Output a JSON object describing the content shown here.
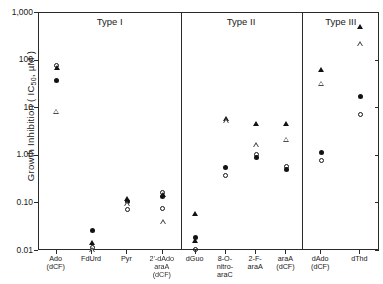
{
  "chart_data": {
    "type": "scatter",
    "title": "",
    "xlabel": "",
    "ylabel": "Growth Inhibition ( IC50, µM )",
    "ylabel_parts": {
      "pre": "Growth Inhibition ( IC",
      "sub": "50",
      "post": ", µM )"
    },
    "yscale": "log",
    "ylim": [
      0.01,
      1000
    ],
    "ytick_labels": [
      "1,000",
      "100",
      "10",
      "1.00",
      "0.10",
      "0.01"
    ],
    "ytick_values": [
      1000,
      100,
      10,
      1.0,
      0.1,
      0.01
    ],
    "grid": false,
    "legend_position": "none",
    "panels": [
      {
        "name": "Type I",
        "categories": [
          {
            "label_lines": [
              "Ado",
              "(dCF)"
            ]
          },
          {
            "label_lines": [
              "FdUrd"
            ]
          },
          {
            "label_lines": [
              "Pyr"
            ]
          },
          {
            "label_lines": [
              "2'-dAdo",
              "araA",
              "(dCF)"
            ]
          }
        ]
      },
      {
        "name": "Type II",
        "categories": [
          {
            "label_lines": [
              "dGuo"
            ]
          },
          {
            "label_lines": [
              "8-O-",
              "nitro-",
              "araC"
            ]
          },
          {
            "label_lines": [
              "2-F-",
              "araA"
            ]
          },
          {
            "label_lines": [
              "araA",
              "(dCF)"
            ]
          }
        ]
      },
      {
        "name": "Type III",
        "categories": [
          {
            "label_lines": [
              "dAdo",
              "(dCF)"
            ]
          },
          {
            "label_lines": [
              "dThd"
            ]
          }
        ]
      }
    ],
    "series": [
      {
        "name": "filled-circle",
        "marker": "m-filled-circle"
      },
      {
        "name": "open-circle",
        "marker": "m-open-circle"
      },
      {
        "name": "filled-triangle",
        "marker": "m-filled-triangle"
      },
      {
        "name": "open-triangle",
        "marker": "m-open-triangle"
      }
    ],
    "points": [
      {
        "panel": 0,
        "cat": 0,
        "series": "open-circle",
        "value": 80
      },
      {
        "panel": 0,
        "cat": 0,
        "series": "filled-triangle",
        "value": 72
      },
      {
        "panel": 0,
        "cat": 0,
        "series": "filled-circle",
        "value": 38
      },
      {
        "panel": 0,
        "cat": 0,
        "series": "open-triangle",
        "value": 8.5
      },
      {
        "panel": 0,
        "cat": 1,
        "series": "filled-circle",
        "value": 0.027
      },
      {
        "panel": 0,
        "cat": 1,
        "series": "filled-triangle",
        "value": 0.0145
      },
      {
        "panel": 0,
        "cat": 1,
        "series": "open-circle",
        "value": 0.0118
      },
      {
        "panel": 0,
        "cat": 1,
        "series": "open-triangle",
        "value": 0.0103
      },
      {
        "panel": 0,
        "cat": 2,
        "series": "filled-triangle",
        "value": 0.125
      },
      {
        "panel": 0,
        "cat": 2,
        "series": "filled-circle",
        "value": 0.112
      },
      {
        "panel": 0,
        "cat": 2,
        "series": "open-triangle",
        "value": 0.098
      },
      {
        "panel": 0,
        "cat": 2,
        "series": "open-circle",
        "value": 0.075
      },
      {
        "panel": 0,
        "cat": 3,
        "series": "open-circle",
        "value": 0.168
      },
      {
        "panel": 0,
        "cat": 3,
        "series": "filled-triangle",
        "value": 0.15
      },
      {
        "panel": 0,
        "cat": 3,
        "series": "filled-circle",
        "value": 0.142
      },
      {
        "panel": 0,
        "cat": 3,
        "series": "open-circle",
        "value": 0.079
      },
      {
        "panel": 0,
        "cat": 3,
        "series": "open-triangle",
        "value": 0.04
      },
      {
        "panel": 1,
        "cat": 0,
        "series": "filled-triangle",
        "value": 0.06
      },
      {
        "panel": 1,
        "cat": 0,
        "series": "filled-circle",
        "value": 0.019
      },
      {
        "panel": 1,
        "cat": 0,
        "series": "filled-triangle",
        "value": 0.016
      },
      {
        "panel": 1,
        "cat": 0,
        "series": "open-circle",
        "value": 0.0105
      },
      {
        "panel": 1,
        "cat": 1,
        "series": "filled-triangle",
        "value": 6.1
      },
      {
        "panel": 1,
        "cat": 1,
        "series": "open-triangle",
        "value": 5.4
      },
      {
        "panel": 1,
        "cat": 1,
        "series": "filled-circle",
        "value": 0.58
      },
      {
        "panel": 1,
        "cat": 1,
        "series": "open-circle",
        "value": 0.39
      },
      {
        "panel": 1,
        "cat": 2,
        "series": "filled-triangle",
        "value": 4.7
      },
      {
        "panel": 1,
        "cat": 2,
        "series": "open-triangle",
        "value": 1.65
      },
      {
        "panel": 1,
        "cat": 2,
        "series": "open-circle",
        "value": 1.05
      },
      {
        "panel": 1,
        "cat": 2,
        "series": "filled-circle",
        "value": 0.9
      },
      {
        "panel": 1,
        "cat": 3,
        "series": "filled-triangle",
        "value": 4.7
      },
      {
        "panel": 1,
        "cat": 3,
        "series": "open-triangle",
        "value": 2.2
      },
      {
        "panel": 1,
        "cat": 3,
        "series": "open-circle",
        "value": 0.6
      },
      {
        "panel": 1,
        "cat": 3,
        "series": "filled-circle",
        "value": 0.52
      },
      {
        "panel": 2,
        "cat": 0,
        "series": "filled-triangle",
        "value": 65
      },
      {
        "panel": 2,
        "cat": 0,
        "series": "open-triangle",
        "value": 33
      },
      {
        "panel": 2,
        "cat": 0,
        "series": "filled-circle",
        "value": 1.18
      },
      {
        "panel": 2,
        "cat": 0,
        "series": "open-circle",
        "value": 0.8
      },
      {
        "panel": 2,
        "cat": 1,
        "series": "filled-triangle",
        "value": 520
      },
      {
        "panel": 2,
        "cat": 1,
        "series": "open-triangle",
        "value": 220
      },
      {
        "panel": 2,
        "cat": 1,
        "series": "filled-circle",
        "value": 18
      },
      {
        "panel": 2,
        "cat": 1,
        "series": "open-circle",
        "value": 7.5
      }
    ]
  }
}
